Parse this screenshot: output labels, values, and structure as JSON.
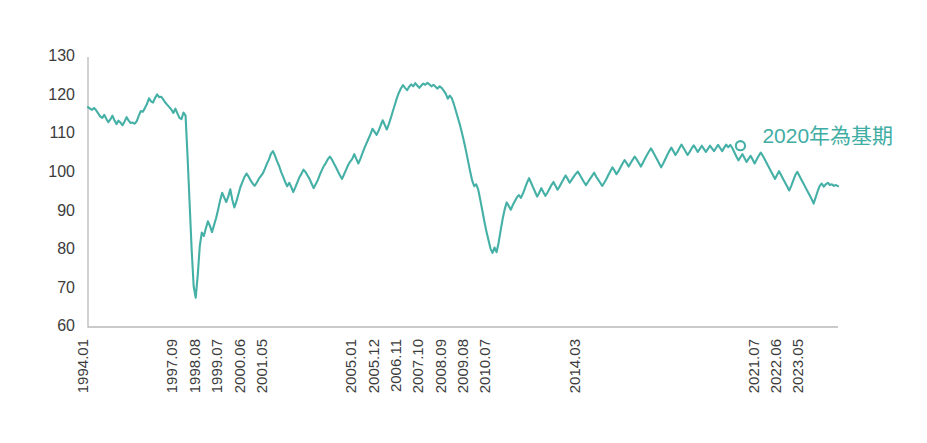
{
  "chart_data": {
    "type": "line",
    "title": "",
    "subtitle": "",
    "xlabel": "",
    "ylabel": "",
    "ylim": [
      60,
      130
    ],
    "yticks": [
      60,
      70,
      80,
      90,
      100,
      110,
      120,
      130
    ],
    "ytick_labels": [
      "60",
      "70",
      "80",
      "90",
      "100",
      "110",
      "120",
      "130"
    ],
    "grid": false,
    "legend": null,
    "series_color": "#45b0a6",
    "annotation_color": "#3fada4",
    "axis_color": "#b9b9b9",
    "annotations": [
      {
        "name": "base-period-note",
        "text": "2020年為基期",
        "x_index": 321,
        "value": 107.0,
        "marker": "hollow-circle"
      }
    ],
    "x_tick_labels": [
      {
        "index": 0,
        "label": "1994.01"
      },
      {
        "index": 44,
        "label": "1997.09"
      },
      {
        "index": 55,
        "label": "1998.08"
      },
      {
        "index": 66,
        "label": "1999.07"
      },
      {
        "index": 77,
        "label": "2000.06"
      },
      {
        "index": 88,
        "label": "2001.05"
      },
      {
        "index": 132,
        "label": "2005.01"
      },
      {
        "index": 143,
        "label": "2005.12"
      },
      {
        "index": 154,
        "label": "2006.11"
      },
      {
        "index": 165,
        "label": "2007.10"
      },
      {
        "index": 176,
        "label": "2008.09"
      },
      {
        "index": 187,
        "label": "2009.08"
      },
      {
        "index": 198,
        "label": "2010.07"
      },
      {
        "index": 242,
        "label": "2014.03"
      },
      {
        "index": 330,
        "label": "2021.07"
      },
      {
        "index": 341,
        "label": "2022.06"
      },
      {
        "index": 352,
        "label": "2023.05"
      }
    ],
    "x_start": "1994.01",
    "x_end": "2023.12",
    "x_frequency": "monthly",
    "n_points": 360,
    "values": [
      117.0,
      116.6,
      116.3,
      116.8,
      116.2,
      115.4,
      114.6,
      114.2,
      115.0,
      114.0,
      113.1,
      113.8,
      114.8,
      113.6,
      112.6,
      113.5,
      113.0,
      112.3,
      113.3,
      114.4,
      113.5,
      112.9,
      113.0,
      112.7,
      113.4,
      114.8,
      116.0,
      115.8,
      116.8,
      117.8,
      119.3,
      118.5,
      118.2,
      119.4,
      120.3,
      119.6,
      119.7,
      119.0,
      118.2,
      117.6,
      117.0,
      116.4,
      115.5,
      116.6,
      115.4,
      114.2,
      113.9,
      115.6,
      114.8,
      104.0,
      92.0,
      80.0,
      70.5,
      67.6,
      73.5,
      81.0,
      84.5,
      83.6,
      85.6,
      87.4,
      86.2,
      84.6,
      86.4,
      88.2,
      90.4,
      92.8,
      94.8,
      93.6,
      92.4,
      93.8,
      95.7,
      93.0,
      91.0,
      92.5,
      94.4,
      96.3,
      97.6,
      98.9,
      99.8,
      99.0,
      98.0,
      97.2,
      96.6,
      97.4,
      98.4,
      99.1,
      99.8,
      101.0,
      102.3,
      103.4,
      104.9,
      105.6,
      104.4,
      103.0,
      101.8,
      100.2,
      99.0,
      97.6,
      96.5,
      97.4,
      96.3,
      95.0,
      96.2,
      97.5,
      98.8,
      99.7,
      100.8,
      100.2,
      99.3,
      98.4,
      97.2,
      96.0,
      97.0,
      98.0,
      99.4,
      100.6,
      101.7,
      102.5,
      103.5,
      104.2,
      103.4,
      102.4,
      101.4,
      100.3,
      99.3,
      98.4,
      99.6,
      100.8,
      102.0,
      102.9,
      103.6,
      104.8,
      103.6,
      102.4,
      103.6,
      105.0,
      106.4,
      107.6,
      108.8,
      110.0,
      111.4,
      110.6,
      109.8,
      110.9,
      112.3,
      113.6,
      112.4,
      111.2,
      112.6,
      114.2,
      116.0,
      117.7,
      119.4,
      120.8,
      121.9,
      122.7,
      122.0,
      121.4,
      122.3,
      122.9,
      122.4,
      123.2,
      122.6,
      122.0,
      122.6,
      123.1,
      122.8,
      123.3,
      122.9,
      122.4,
      122.8,
      122.3,
      121.8,
      122.4,
      122.0,
      121.3,
      120.5,
      119.2,
      120.0,
      119.3,
      117.8,
      116.0,
      114.2,
      112.4,
      110.3,
      108.0,
      105.6,
      103.0,
      100.4,
      98.0,
      96.5,
      97.0,
      95.6,
      93.0,
      90.2,
      87.4,
      84.8,
      82.6,
      80.4,
      79.2,
      80.6,
      79.4,
      81.8,
      85.0,
      88.0,
      90.5,
      92.3,
      91.4,
      90.4,
      91.6,
      92.6,
      93.6,
      94.2,
      93.5,
      94.6,
      96.0,
      97.4,
      98.6,
      97.4,
      96.2,
      95.0,
      93.8,
      94.8,
      96.0,
      95.0,
      94.0,
      94.8,
      95.8,
      96.8,
      97.6,
      96.6,
      95.6,
      96.4,
      97.4,
      98.4,
      99.3,
      98.4,
      97.4,
      98.2,
      99.0,
      99.7,
      100.3,
      99.4,
      98.5,
      97.6,
      96.8,
      97.6,
      98.4,
      99.2,
      100.0,
      99.0,
      98.2,
      97.4,
      96.6,
      97.4,
      98.3,
      99.4,
      100.4,
      101.4,
      100.6,
      99.6,
      100.4,
      101.4,
      102.4,
      103.3,
      102.5,
      101.6,
      102.5,
      103.4,
      104.2,
      103.4,
      102.5,
      101.6,
      102.6,
      103.6,
      104.6,
      105.5,
      106.3,
      105.4,
      104.4,
      103.4,
      102.4,
      101.4,
      102.4,
      103.5,
      104.6,
      105.6,
      106.5,
      105.6,
      104.6,
      105.4,
      106.4,
      107.3,
      106.4,
      105.5,
      104.6,
      105.4,
      106.3,
      107.1,
      106.3,
      105.4,
      106.2,
      107.0,
      106.2,
      105.4,
      106.2,
      107.0,
      106.3,
      105.6,
      106.4,
      107.2,
      106.4,
      105.6,
      106.5,
      107.3,
      106.6,
      107.2,
      106.4,
      105.3,
      104.2,
      103.2,
      104.0,
      104.8,
      103.8,
      102.8,
      103.6,
      104.4,
      103.4,
      102.4,
      103.4,
      104.4,
      105.2,
      104.4,
      103.4,
      102.4,
      101.4,
      100.4,
      99.4,
      98.4,
      99.4,
      100.4,
      99.4,
      98.4,
      97.4,
      96.4,
      95.4,
      96.6,
      98.0,
      99.4,
      100.2,
      99.2,
      98.2,
      97.2,
      96.2,
      95.2,
      94.2,
      93.2,
      92.0,
      93.6,
      95.2,
      96.6,
      97.2,
      96.4,
      97.0,
      97.4,
      96.8,
      97.0,
      96.6,
      96.8,
      96.5
    ]
  },
  "layout": {
    "plot_left": 88,
    "plot_right": 838,
    "plot_top": 57,
    "plot_bottom": 327
  }
}
